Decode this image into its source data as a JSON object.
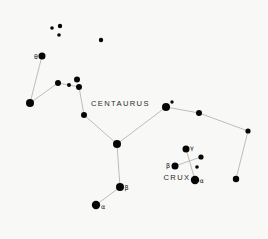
{
  "figure": {
    "width": 268,
    "height": 239,
    "background_color": "#f8f8f6",
    "star_color": "#060606",
    "line_color": "#b6b6b6",
    "title_color": "#2b2b2b",
    "label_color": "#101010"
  },
  "constellations": [
    {
      "id": "centaurus",
      "name": "CENTAURUS",
      "stars": [
        {
          "id": "theta-cen",
          "x": 42,
          "y": 56,
          "r": 3.5,
          "label": "θ",
          "label_dx": -8,
          "label_dy": 2.5
        },
        {
          "id": "cen-w1",
          "x": 30,
          "y": 103,
          "r": 4.0
        },
        {
          "id": "cen-w2",
          "x": 58,
          "y": 83,
          "r": 3.0
        },
        {
          "id": "cen-w3",
          "x": 69,
          "y": 85,
          "r": 2.0
        },
        {
          "id": "cen-w4",
          "x": 77,
          "y": 79.5,
          "r": 3.0
        },
        {
          "id": "cen-w5",
          "x": 79,
          "y": 87,
          "r": 3.0
        },
        {
          "id": "cen-c1",
          "x": 84,
          "y": 115,
          "r": 3.0
        },
        {
          "id": "cen-hub",
          "x": 117,
          "y": 144,
          "r": 4.0
        },
        {
          "id": "beta-cen",
          "x": 120,
          "y": 187,
          "r": 4.0,
          "label": "β",
          "label_dx": 4.5,
          "label_dy": 3
        },
        {
          "id": "alpha-cen",
          "x": 96,
          "y": 205,
          "r": 4.2,
          "label": "α",
          "label_dx": 5,
          "label_dy": 3.5
        },
        {
          "id": "cen-e1",
          "x": 166,
          "y": 107,
          "r": 4.0
        },
        {
          "id": "cen-e2",
          "x": 172,
          "y": 102,
          "r": 1.7
        },
        {
          "id": "cen-e3",
          "x": 199,
          "y": 113,
          "r": 3.0
        },
        {
          "id": "cen-e4",
          "x": 248,
          "y": 131,
          "r": 2.6
        },
        {
          "id": "cen-e5",
          "x": 236,
          "y": 179,
          "r": 3.2
        }
      ],
      "lines": [
        [
          0,
          1
        ],
        [
          1,
          2
        ],
        [
          2,
          3
        ],
        [
          3,
          5
        ],
        [
          5,
          6
        ],
        [
          6,
          7
        ],
        [
          7,
          8
        ],
        [
          8,
          9
        ],
        [
          7,
          10
        ],
        [
          10,
          12
        ],
        [
          12,
          13
        ],
        [
          13,
          14
        ]
      ]
    },
    {
      "id": "crux",
      "name": "CRUX",
      "stars": [
        {
          "id": "gamma-cru",
          "x": 186,
          "y": 149,
          "r": 3.5,
          "label": "γ",
          "label_dx": 4,
          "label_dy": 1
        },
        {
          "id": "delta-cru",
          "x": 201,
          "y": 157,
          "r": 2.6
        },
        {
          "id": "beta-cru",
          "x": 175,
          "y": 166,
          "r": 3.5,
          "label": "β",
          "label_dx": -9,
          "label_dy": 1.5
        },
        {
          "id": "epsilon-cru",
          "x": 197,
          "y": 167,
          "r": 1.8
        },
        {
          "id": "alpha-cru",
          "x": 195,
          "y": 180,
          "r": 4.2,
          "label": "α",
          "label_dx": 4.5,
          "label_dy": 3
        }
      ],
      "lines": [
        [
          0,
          4
        ],
        [
          2,
          1
        ]
      ]
    }
  ],
  "field_stars": [
    {
      "id": "field-1",
      "x": 52,
      "y": 28,
      "r": 1.8
    },
    {
      "id": "field-2",
      "x": 60,
      "y": 26,
      "r": 2.2
    },
    {
      "id": "field-3",
      "x": 59,
      "y": 35,
      "r": 1.8
    },
    {
      "id": "field-4",
      "x": 101,
      "y": 40,
      "r": 2.2
    }
  ]
}
